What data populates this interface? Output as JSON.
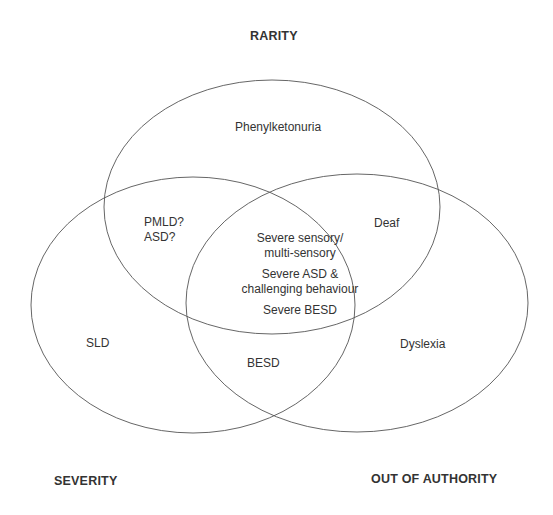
{
  "diagram": {
    "type": "venn",
    "sets": [
      {
        "id": "rarity",
        "label": "RARITY",
        "ellipse": {
          "cx": 272,
          "cy": 207,
          "rx": 168,
          "ry": 127
        }
      },
      {
        "id": "severity",
        "label": "SEVERITY",
        "ellipse": {
          "cx": 193,
          "cy": 305,
          "rx": 162,
          "ry": 128
        }
      },
      {
        "id": "out_of_authority",
        "label": "OUT OF AUTHORITY",
        "ellipse": {
          "cx": 357,
          "cy": 303,
          "rx": 171,
          "ry": 129
        }
      }
    ],
    "stroke_color": "#555555",
    "regions": {
      "rarity_only": [
        "Phenylketonuria"
      ],
      "rarity_severity": [
        "PMLD?",
        "ASD?"
      ],
      "rarity_out_of_authority": [
        "Deaf"
      ],
      "all_three": {
        "line1a": "Severe sensory/",
        "line1b": "multi-sensory",
        "line2a": "Severe ASD &",
        "line2b": "challenging behaviour",
        "line3": "Severe BESD"
      },
      "severity_only": [
        "SLD"
      ],
      "severity_out_of_authority": [
        "BESD"
      ],
      "out_of_authority_only": [
        "Dyslexia"
      ]
    }
  }
}
